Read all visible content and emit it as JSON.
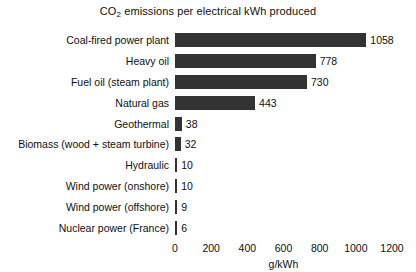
{
  "chart_data": {
    "type": "bar",
    "orientation": "horizontal",
    "title": "CO2 emissions per electrical kWh produced",
    "title_prefix": "CO",
    "title_subscript": "2",
    "title_suffix": " emissions per electrical kWh produced",
    "xlabel": "g/kWh",
    "ylabel": "",
    "xlim": [
      0,
      1200
    ],
    "xticks": [
      0,
      200,
      400,
      600,
      800,
      1000,
      1200
    ],
    "xtick_labels": [
      "0",
      "200",
      "400",
      "600",
      "800",
      "1000",
      "1200"
    ],
    "grid": false,
    "legend": null,
    "bar_color": "#333333",
    "background_color": "#ffffff",
    "categories": [
      "Coal-fired power plant",
      "Heavy oil",
      "Fuel oil (steam plant)",
      "Natural gas",
      "Geothermal",
      "Biomass (wood + steam turbine)",
      "Hydraulic",
      "Wind power (onshore)",
      "Wind power (offshore)",
      "Nuclear power (France)"
    ],
    "values": [
      1058,
      778,
      730,
      443,
      38,
      32,
      10,
      10,
      9,
      6
    ],
    "value_labels": [
      "1058",
      "778",
      "730",
      "443",
      "38",
      "32",
      "10",
      "10",
      "9",
      "6"
    ]
  }
}
